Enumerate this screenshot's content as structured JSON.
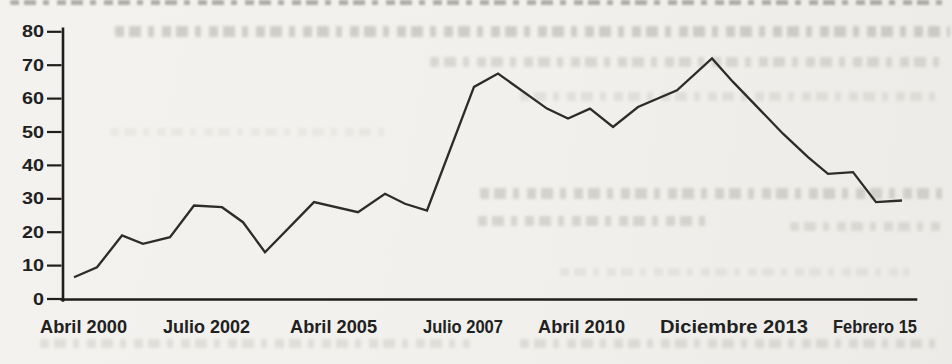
{
  "page": {
    "background": "#f1f0ec",
    "description_visible_text_only": true
  },
  "style": {
    "axis_color": "#1e1e1c",
    "line_color": "#2c2c2a",
    "label_color": "#21211f",
    "paper_color": "#f1f0ec",
    "ghost_text_color": "#807e76"
  },
  "chart_data": {
    "type": "line",
    "title": "",
    "xlabel": "",
    "ylabel": "",
    "grid": false,
    "legend": null,
    "ylim": [
      0,
      80
    ],
    "y_axis": {
      "ticks": [
        0,
        10,
        20,
        30,
        40,
        50,
        60,
        70,
        80
      ]
    },
    "x_axis": {
      "tick_labels": [
        "Abril 2000",
        "Julio 2002",
        "Abril 2005",
        "Julio 2007",
        "Abril 2010",
        "Diciembre 2013",
        "Febrero 15"
      ],
      "tick_centers_px": [
        83,
        207,
        333,
        463,
        581,
        734,
        875
      ],
      "tick_spans_px": [
        [
          40,
          127
        ],
        [
          163,
          250
        ],
        [
          290,
          377
        ],
        [
          423,
          503
        ],
        [
          538,
          625
        ],
        [
          660,
          808
        ],
        [
          833,
          917
        ]
      ]
    },
    "series": [
      {
        "name": "serie",
        "points": [
          {
            "x_px": 74,
            "value": 6.5
          },
          {
            "x_px": 97,
            "value": 9.5
          },
          {
            "x_px": 122,
            "value": 19
          },
          {
            "x_px": 143,
            "value": 16.5
          },
          {
            "x_px": 170,
            "value": 18.5
          },
          {
            "x_px": 194,
            "value": 28
          },
          {
            "x_px": 222,
            "value": 27.5
          },
          {
            "x_px": 243,
            "value": 23
          },
          {
            "x_px": 265,
            "value": 14
          },
          {
            "x_px": 314,
            "value": 29
          },
          {
            "x_px": 358,
            "value": 26
          },
          {
            "x_px": 385,
            "value": 31.5
          },
          {
            "x_px": 405,
            "value": 28.5
          },
          {
            "x_px": 427,
            "value": 26.5
          },
          {
            "x_px": 474,
            "value": 63.5
          },
          {
            "x_px": 498,
            "value": 67.5
          },
          {
            "x_px": 547,
            "value": 57
          },
          {
            "x_px": 568,
            "value": 54
          },
          {
            "x_px": 590,
            "value": 57
          },
          {
            "x_px": 613,
            "value": 51.5
          },
          {
            "x_px": 638,
            "value": 57.5
          },
          {
            "x_px": 677,
            "value": 62.5
          },
          {
            "x_px": 712,
            "value": 72
          },
          {
            "x_px": 733,
            "value": 65
          },
          {
            "x_px": 783,
            "value": 49.5
          },
          {
            "x_px": 808,
            "value": 42.5
          },
          {
            "x_px": 828,
            "value": 37.5
          },
          {
            "x_px": 853,
            "value": 38
          },
          {
            "x_px": 876,
            "value": 29
          },
          {
            "x_px": 902,
            "value": 29.5
          }
        ]
      }
    ]
  }
}
